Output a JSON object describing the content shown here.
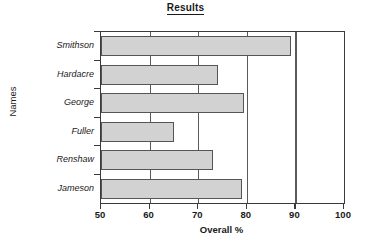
{
  "chart_data": {
    "type": "bar",
    "orientation": "horizontal",
    "title": "Results",
    "xlabel": "Overall %",
    "ylabel": "Names",
    "categories": [
      "Smithson",
      "Hardacre",
      "George",
      "Fuller",
      "Renshaw",
      "Jameson"
    ],
    "values": [
      89,
      74,
      79.5,
      65,
      73,
      79
    ],
    "xlim": [
      50,
      100
    ],
    "xticks": [
      50,
      60,
      70,
      80,
      90,
      100
    ],
    "xtick_labels": [
      "50",
      "60",
      "70",
      "80",
      "90",
      "100"
    ],
    "gridlines": [
      60,
      70,
      80,
      90
    ],
    "grid": true,
    "legend": "none",
    "bar_fill_color": "#d2d2d2",
    "bar_border_color": "#555555",
    "axis_color": "#3a3a3a",
    "text_color": "#1a1a1a"
  }
}
